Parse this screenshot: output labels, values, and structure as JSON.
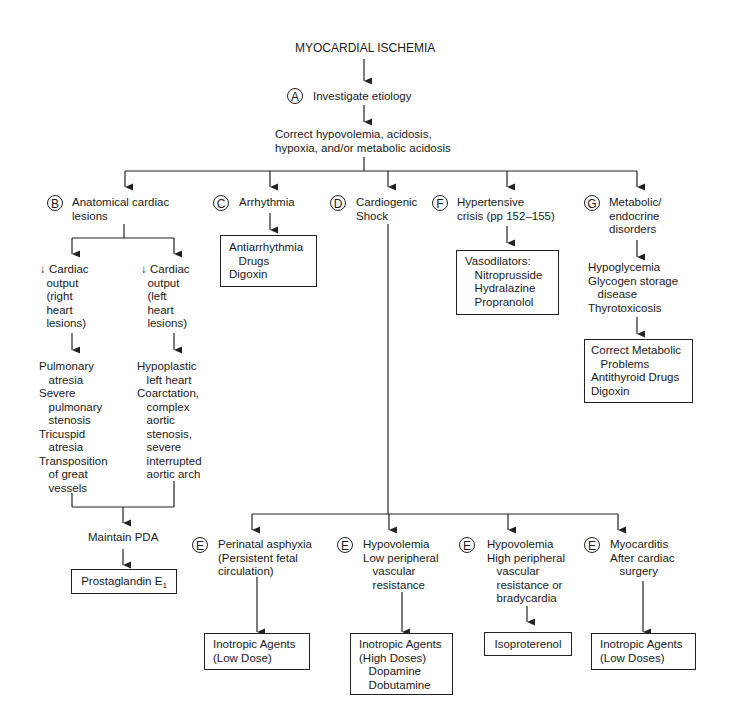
{
  "title": "MYOCARDIAL ISCHEMIA",
  "step_a": {
    "letter": "A",
    "label": "Investigate etiology"
  },
  "correct": [
    "Correct hypovolemia, acidosis,",
    "hypoxia, and/or metabolic acidosis"
  ],
  "branches": {
    "b": {
      "letter": "B",
      "label": [
        "Anatomical cardiac",
        "lesions"
      ],
      "right": {
        "arrow": "↓",
        "label": [
          "Cardiac",
          "output",
          "(right",
          "heart",
          "lesions)"
        ],
        "items": [
          "Pulmonary",
          "atresia",
          "Severe",
          "pulmonary",
          "stenosis",
          "Tricuspid",
          "atresia",
          "Transposition",
          "of great",
          "vessels"
        ]
      },
      "left": {
        "arrow": "↓",
        "label": [
          "Cardiac",
          "output",
          "(left",
          "heart",
          "lesions)"
        ],
        "items": [
          "Hypoplastic",
          "left heart",
          "Coarctation,",
          "complex",
          "aortic",
          "stenosis,",
          "severe",
          "interrupted",
          "aortic arch"
        ]
      },
      "maintain": "Maintain PDA",
      "treatment": "Prostaglandin E",
      "treatment_sub": "1"
    },
    "c": {
      "letter": "C",
      "label": "Arrhythmia",
      "treatment": [
        "Antiarrhythmia",
        "Drugs",
        "Digoxin"
      ]
    },
    "d": {
      "letter": "D",
      "label": [
        "Cardiogenic",
        "Shock"
      ]
    },
    "f": {
      "letter": "F",
      "label": [
        "Hypertensive",
        "crisis (pp 152–155)"
      ],
      "treatment": [
        "Vasodilators:",
        "Nitroprusside",
        "Hydralazine",
        "Propranolol"
      ]
    },
    "g": {
      "letter": "G",
      "label": [
        "Metabolic/",
        "endocrine",
        "disorders"
      ],
      "items": [
        "Hypoglycemia",
        "Glycogen storage",
        "disease",
        "Thyrotoxicosis"
      ],
      "treatment": [
        "Correct Metabolic",
        "Problems",
        "Antithyroid Drugs",
        "Digoxin"
      ]
    }
  },
  "shock_types": [
    {
      "letter": "E",
      "label": [
        "Perinatal asphyxia",
        "(Persistent fetal",
        "circulation)"
      ],
      "treatment": [
        "Inotropic Agents",
        "(Low Dose)"
      ]
    },
    {
      "letter": "E",
      "label": [
        "Hypovolemia",
        "Low peripheral",
        "vascular",
        "resistance"
      ],
      "treatment": [
        "Inotropic Agents",
        "(High Doses)",
        "Dopamine",
        "Dobutamine"
      ]
    },
    {
      "letter": "E",
      "label": [
        "Hypovolemia",
        "High peripheral",
        "vascular",
        "resistance or",
        "bradycardia"
      ],
      "treatment": [
        "Isoproterenol"
      ]
    },
    {
      "letter": "E",
      "label": [
        "Myocarditis",
        "After cardiac",
        "surgery"
      ],
      "treatment": [
        "Inotropic Agents",
        "(Low Doses)"
      ]
    }
  ]
}
